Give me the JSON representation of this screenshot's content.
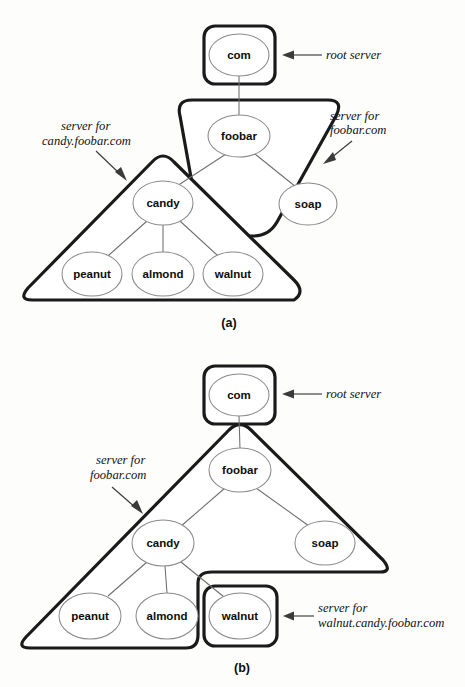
{
  "figure": {
    "background_color": "#fdfdfc",
    "zone_border_color": "#1a1a1a",
    "node_border_color": "#8a8a8a",
    "edge_color": "#6e6e6e",
    "text_color": "#111111"
  },
  "panels": [
    {
      "id": "a",
      "caption": "(a)",
      "nodes": [
        {
          "id": "com",
          "label": "com",
          "cx": 239,
          "cy": 55,
          "rx": 30,
          "ry": 21
        },
        {
          "id": "foobar",
          "label": "foobar",
          "cx": 239,
          "cy": 136,
          "rx": 31,
          "ry": 21
        },
        {
          "id": "soap",
          "label": "soap",
          "cx": 308,
          "cy": 204,
          "rx": 29,
          "ry": 21
        },
        {
          "id": "candy",
          "label": "candy",
          "cx": 163,
          "cy": 203,
          "rx": 30,
          "ry": 22
        },
        {
          "id": "peanut",
          "label": "peanut",
          "cx": 92,
          "cy": 274,
          "rx": 30,
          "ry": 22
        },
        {
          "id": "almond",
          "label": "almond",
          "cx": 163,
          "cy": 274,
          "rx": 31,
          "ry": 22
        },
        {
          "id": "walnut",
          "label": "walnut",
          "cx": 233,
          "cy": 274,
          "rx": 30,
          "ry": 22
        }
      ],
      "edges": [
        {
          "from": "com",
          "to": "foobar"
        },
        {
          "from": "foobar",
          "to": "candy"
        },
        {
          "from": "foobar",
          "to": "soap"
        },
        {
          "from": "candy",
          "to": "peanut"
        },
        {
          "from": "candy",
          "to": "almond"
        },
        {
          "from": "candy",
          "to": "walnut"
        }
      ],
      "zones": [
        {
          "id": "root",
          "shape": "rounded-box",
          "label_for": "root server"
        },
        {
          "id": "foobar",
          "shape": "slanted-band",
          "label_for": "server for foobar.com"
        },
        {
          "id": "candy",
          "shape": "triangle",
          "label_for": "server for candy.foobar.com"
        }
      ],
      "annotations": [
        {
          "id": "root-server-a",
          "lines": [
            "root server"
          ],
          "x": 326,
          "y": 59
        },
        {
          "id": "foobar-com-a",
          "lines": [
            "server for",
            "foobar.com"
          ],
          "x": 330,
          "y": 120
        },
        {
          "id": "candy-foobar-a",
          "lines": [
            "server for",
            "candy.foobar.com"
          ],
          "x": 42,
          "y": 130
        }
      ]
    },
    {
      "id": "b",
      "caption": "(b)",
      "nodes": [
        {
          "id": "com",
          "label": "com",
          "cx": 239,
          "cy": 395,
          "rx": 30,
          "ry": 21
        },
        {
          "id": "foobar",
          "label": "foobar",
          "cx": 240,
          "cy": 470,
          "rx": 31,
          "ry": 22
        },
        {
          "id": "soap",
          "label": "soap",
          "cx": 325,
          "cy": 543,
          "rx": 30,
          "ry": 22
        },
        {
          "id": "candy",
          "label": "candy",
          "cx": 163,
          "cy": 543,
          "rx": 31,
          "ry": 23
        },
        {
          "id": "peanut",
          "label": "peanut",
          "cx": 90,
          "cy": 616,
          "rx": 31,
          "ry": 23
        },
        {
          "id": "almond",
          "label": "almond",
          "cx": 167,
          "cy": 616,
          "rx": 31,
          "ry": 23
        },
        {
          "id": "walnut",
          "label": "walnut",
          "cx": 240,
          "cy": 616,
          "rx": 31,
          "ry": 23
        }
      ],
      "edges": [
        {
          "from": "com",
          "to": "foobar"
        },
        {
          "from": "foobar",
          "to": "candy"
        },
        {
          "from": "foobar",
          "to": "soap"
        },
        {
          "from": "candy",
          "to": "peanut"
        },
        {
          "from": "candy",
          "to": "almond"
        },
        {
          "from": "candy",
          "to": "walnut"
        }
      ],
      "zones": [
        {
          "id": "root",
          "shape": "rounded-box",
          "label_for": "root server"
        },
        {
          "id": "foobar",
          "shape": "notched-triangle",
          "label_for": "server for foobar.com"
        },
        {
          "id": "walnut",
          "shape": "rounded-box",
          "label_for": "server for walnut.candy.foobar.com"
        }
      ],
      "annotations": [
        {
          "id": "root-server-b",
          "lines": [
            "root server"
          ],
          "x": 326,
          "y": 398
        },
        {
          "id": "foobar-com-b",
          "lines": [
            "server for",
            "foobar.com"
          ],
          "x": 90,
          "y": 458
        },
        {
          "id": "walnut-candy-b",
          "lines": [
            "server for",
            "walnut.candy.foobar.com"
          ],
          "x": 307,
          "y": 608
        }
      ]
    }
  ]
}
